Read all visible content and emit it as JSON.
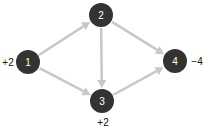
{
  "diagram": {
    "type": "directed-network",
    "colors": {
      "node": "#333333",
      "edge": "#c8c8c8",
      "node_text": "#ffffff",
      "label_text": "#111111"
    },
    "nodes": [
      {
        "id": "1",
        "label": "1",
        "supply": "+2"
      },
      {
        "id": "2",
        "label": "2",
        "supply": ""
      },
      {
        "id": "3",
        "label": "3",
        "supply": "+2"
      },
      {
        "id": "4",
        "label": "4",
        "supply": "−4"
      }
    ],
    "edges": [
      {
        "from": "1",
        "to": "2"
      },
      {
        "from": "1",
        "to": "3"
      },
      {
        "from": "2",
        "to": "3"
      },
      {
        "from": "2",
        "to": "4"
      },
      {
        "from": "3",
        "to": "4"
      }
    ]
  }
}
